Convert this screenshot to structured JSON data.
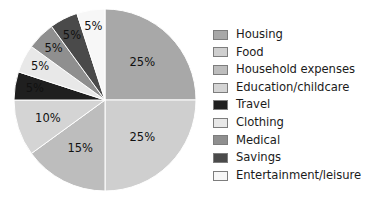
{
  "chart_data": {
    "type": "pie",
    "title": "",
    "subtitle": "",
    "xlabel": "",
    "ylabel": "",
    "legend_position": "right",
    "grid": false,
    "start_angle_deg": 0,
    "direction": "clockwise",
    "categories": [
      "Housing",
      "Food",
      "Household expenses",
      "Education/childcare",
      "Travel",
      "Clothing",
      "Medical",
      "Savings",
      "Entertainment/leisure"
    ],
    "values": [
      25,
      25,
      15,
      10,
      5,
      5,
      5,
      5,
      5
    ],
    "value_labels": [
      "25%",
      "25%",
      "15%",
      "10%",
      "5%",
      "5%",
      "5%",
      "5%",
      "5%"
    ],
    "colors": [
      "#a8a8a8",
      "#cfcfcf",
      "#bdbdbd",
      "#d4d4d4",
      "#1f1f1f",
      "#e8e8e8",
      "#8f8f8f",
      "#4a4a4a",
      "#f7f7f7"
    ],
    "slices": [
      {
        "label": "Housing",
        "value": 25,
        "value_label": "25%",
        "color": "#a8a8a8"
      },
      {
        "label": "Food",
        "value": 25,
        "value_label": "25%",
        "color": "#cfcfcf"
      },
      {
        "label": "Household expenses",
        "value": 15,
        "value_label": "15%",
        "color": "#bdbdbd"
      },
      {
        "label": "Education/childcare",
        "value": 10,
        "value_label": "10%",
        "color": "#d4d4d4"
      },
      {
        "label": "Travel",
        "value": 5,
        "value_label": "5%",
        "color": "#1f1f1f"
      },
      {
        "label": "Clothing",
        "value": 5,
        "value_label": "5%",
        "color": "#e8e8e8"
      },
      {
        "label": "Medical",
        "value": 5,
        "value_label": "5%",
        "color": "#8f8f8f"
      },
      {
        "label": "Savings",
        "value": 5,
        "value_label": "5%",
        "color": "#4a4a4a"
      },
      {
        "label": "Entertainment/leisure",
        "value": 5,
        "value_label": "5%",
        "color": "#f7f7f7"
      }
    ]
  },
  "legend": {
    "items": [
      {
        "label": "Housing",
        "color": "#a8a8a8"
      },
      {
        "label": "Food",
        "color": "#cfcfcf"
      },
      {
        "label": "Household expenses",
        "color": "#bdbdbd"
      },
      {
        "label": "Education/childcare",
        "color": "#d4d4d4"
      },
      {
        "label": "Travel",
        "color": "#1f1f1f"
      },
      {
        "label": "Clothing",
        "color": "#e8e8e8"
      },
      {
        "label": "Medical",
        "color": "#8f8f8f"
      },
      {
        "label": "Savings",
        "color": "#4a4a4a"
      },
      {
        "label": "Entertainment/leisure",
        "color": "#f7f7f7"
      }
    ]
  },
  "style": {
    "background": "#ffffff",
    "label_color": "#111111",
    "swatch_border": "#7d7d7d",
    "slice_divider": "#ffffff"
  }
}
